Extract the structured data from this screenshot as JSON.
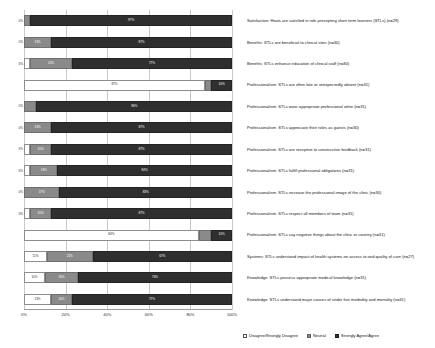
{
  "chart_data": {
    "type": "bar",
    "orientation": "horizontal",
    "stacked": true,
    "stack_mode": "percent",
    "title": "",
    "xlabel": "",
    "ylabel": "",
    "xlim": [
      0,
      100
    ],
    "xticks": [
      "0%",
      "20%",
      "40%",
      "60%",
      "80%",
      "100%"
    ],
    "xtick_values": [
      0,
      20,
      40,
      60,
      80,
      100
    ],
    "grid": true,
    "legend_position": "bottom-right",
    "series": [
      {
        "name": "Disagree/Strongly Disagree",
        "color": "#ffffff"
      },
      {
        "name": "Neutral",
        "color": "#8a8a8a"
      },
      {
        "name": "Strongly Agree/Agree",
        "color": "#2f2f2f"
      }
    ],
    "categories": [
      "Satisfaction: Hosts are satisfied in role precepting short term learners (STLs) (n=29)",
      "Benefits: STLs are beneficial to clinical sites (n=30)",
      "Benefits: STLs enhance education of clinical staff (n=30)",
      "Professionalism: STLs are often late or unexpectedly absent (n=31)",
      "Professionalism: STLs wear appropriate professional attire (n=31)",
      "Professionalism: STLs appreciate their roles as guests (n=30)",
      "Professionalism: STLs are receptive to constructive feedback (n=31)",
      "Professionalism: STLs fulfill professional obligations (n=31)",
      "Professionalism: STLs increase the professional image of the clinic (n=30)",
      "Professionalism: STLs respect all members of team (n=31)",
      "Professionalism: STLs say negative things about the clinic or country (n=31)",
      "Systems: STLs understand impact of health systems on access to and quality of care (n=27)",
      "Knowledge: STLs possess appropriate medical knowledge (n=31)",
      "Knowledge: STLs understand major causes of under five morbidity and mortality (n=31)"
    ],
    "rows": [
      {
        "disagree": 0,
        "neutral": 3,
        "agree": 97,
        "disagree_label": "0%",
        "neutral_label": "3%",
        "agree_label": "97%",
        "left_tick": "0%"
      },
      {
        "disagree": 0,
        "neutral": 13,
        "agree": 87,
        "disagree_label": "0%",
        "neutral_label": "13%",
        "agree_label": "87%",
        "left_tick": "0%"
      },
      {
        "disagree": 3,
        "neutral": 20,
        "agree": 77,
        "disagree_label": "3%",
        "neutral_label": "20%",
        "agree_label": "77%",
        "left_tick": "3%"
      },
      {
        "disagree": 87,
        "neutral": 3,
        "agree": 10,
        "disagree_label": "87%",
        "neutral_label": "3%",
        "agree_label": "10%",
        "left_tick": ""
      },
      {
        "disagree": 0,
        "neutral": 6,
        "agree": 94,
        "disagree_label": "0%",
        "neutral_label": "6%",
        "agree_label": "94%",
        "left_tick": "0%"
      },
      {
        "disagree": 0,
        "neutral": 13,
        "agree": 87,
        "disagree_label": "0%",
        "neutral_label": "13%",
        "agree_label": "87%",
        "left_tick": "0%"
      },
      {
        "disagree": 3,
        "neutral": 10,
        "agree": 87,
        "disagree_label": "3%",
        "neutral_label": "10%",
        "agree_label": "87%",
        "left_tick": "3%"
      },
      {
        "disagree": 3,
        "neutral": 13,
        "agree": 84,
        "disagree_label": "3%",
        "neutral_label": "13%",
        "agree_label": "84%",
        "left_tick": "3%"
      },
      {
        "disagree": 0,
        "neutral": 17,
        "agree": 83,
        "disagree_label": "0%",
        "neutral_label": "17%",
        "agree_label": "83%",
        "left_tick": "0%"
      },
      {
        "disagree": 3,
        "neutral": 10,
        "agree": 87,
        "disagree_label": "3%",
        "neutral_label": "10%",
        "agree_label": "87%",
        "left_tick": "3%"
      },
      {
        "disagree": 84,
        "neutral": 6,
        "agree": 10,
        "disagree_label": "84%",
        "neutral_label": "6%",
        "agree_label": "10%",
        "left_tick": ""
      },
      {
        "disagree": 11,
        "neutral": 22,
        "agree": 67,
        "disagree_label": "11%",
        "neutral_label": "22%",
        "agree_label": "67%",
        "left_tick": ""
      },
      {
        "disagree": 10,
        "neutral": 16,
        "agree": 74,
        "disagree_label": "10%",
        "neutral_label": "16%",
        "agree_label": "74%",
        "left_tick": ""
      },
      {
        "disagree": 13,
        "neutral": 10,
        "agree": 77,
        "disagree_label": "13%",
        "neutral_label": "10%",
        "agree_label": "77%",
        "left_tick": ""
      }
    ]
  }
}
